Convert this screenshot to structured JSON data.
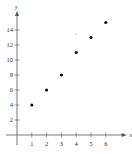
{
  "chart_data": {
    "type": "scatter",
    "title": "",
    "xlabel": "x",
    "ylabel": "y",
    "x": [
      1,
      2,
      3,
      4,
      5,
      6
    ],
    "y": [
      4,
      6,
      8,
      11,
      13,
      15
    ],
    "xticks": [
      "1",
      "2",
      "3",
      "4",
      "5",
      "6"
    ],
    "yticks": [
      "2",
      "4",
      "6",
      "8",
      "10",
      "12",
      "14"
    ],
    "xlim": [
      0,
      7
    ],
    "ylim": [
      0,
      16
    ],
    "grid": false,
    "legend": null,
    "annotations": [
      {
        "text": "*",
        "x": 4,
        "y": 13.5,
        "color": "#aaaaaa"
      }
    ],
    "colors": {
      "points": "#111111",
      "axes": "#555555"
    }
  }
}
